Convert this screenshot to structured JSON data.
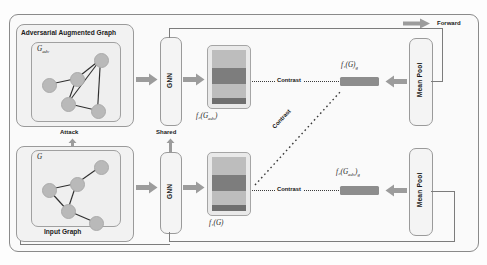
{
  "figure": {
    "type": "architecture-diagram"
  },
  "legend": {
    "forward_label": "Forward",
    "arrow_icon": "right-arrow-icon"
  },
  "branches": {
    "top": {
      "panel_title": "Adversarial Augmented Graph",
      "graph_symbol": "G",
      "graph_subscript": "adv",
      "encoder_label": "GNN",
      "feature_map_label": "f₂(G",
      "feature_map_sub": "adv",
      "feature_map_tail": ")",
      "embedding_label": "f₂(G",
      "embedding_sub": "adv",
      "embedding_tail": ")",
      "embedding_tail_sub": "g",
      "pool_label": "Mean Pool"
    },
    "bottom": {
      "panel_caption": "Input Graph",
      "graph_symbol": "G",
      "encoder_label": "GNN",
      "feature_map_label": "f₁(G)",
      "embedding_label": "f₁(G)",
      "embedding_sub": "g",
      "pool_label": "Mean Pool"
    }
  },
  "connectors": {
    "attack_label": "Attack",
    "shared_label": "Shared",
    "contrast_top_label": "Contrast",
    "contrast_diagonal_label": "Contrast",
    "contrast_bottom_label": "Contrast"
  },
  "graph_top": {
    "nodes": [
      {
        "id": "n1",
        "x": 11,
        "y": 36
      },
      {
        "id": "n2",
        "x": 39,
        "y": 30
      },
      {
        "id": "n3",
        "x": 63,
        "y": 11
      },
      {
        "id": "n4",
        "x": 30,
        "y": 55
      },
      {
        "id": "n5",
        "x": 60,
        "y": 62
      }
    ],
    "edges": [
      {
        "from": "n1",
        "to": "n2"
      },
      {
        "from": "n2",
        "to": "n3"
      },
      {
        "from": "n2",
        "to": "n4"
      },
      {
        "from": "n4",
        "to": "n3"
      },
      {
        "from": "n4",
        "to": "n5"
      },
      {
        "from": "n3",
        "to": "n5"
      }
    ]
  },
  "graph_bottom": {
    "nodes": [
      {
        "id": "m1",
        "x": 11,
        "y": 33
      },
      {
        "id": "m2",
        "x": 39,
        "y": 27
      },
      {
        "id": "m3",
        "x": 63,
        "y": 10
      },
      {
        "id": "m4",
        "x": 30,
        "y": 54
      },
      {
        "id": "m5",
        "x": 58,
        "y": 66
      }
    ],
    "edges": [
      {
        "from": "m1",
        "to": "m2"
      },
      {
        "from": "m2",
        "to": "m3"
      },
      {
        "from": "m2",
        "to": "m4"
      },
      {
        "from": "m4",
        "to": "m1"
      },
      {
        "from": "m4",
        "to": "m5"
      }
    ]
  },
  "feature_map": {
    "stripes": [
      {
        "top": 0,
        "height": 18,
        "color": "#bdbdbd"
      },
      {
        "top": 18,
        "height": 16,
        "color": "#7d7d7d"
      },
      {
        "top": 34,
        "height": 14,
        "color": "#bdbdbd"
      },
      {
        "top": 48,
        "height": 16,
        "color": "#6f6f6f"
      }
    ]
  },
  "colors": {
    "frame_border": "#8a8a8a",
    "panel_fill": "#f2f2f2",
    "node_fill": "#b9b9b9",
    "edge_stroke": "#2f2f2f",
    "arrow_fill": "#9c9c9c",
    "embedding_fill": "#8d8d8d",
    "text": "#1b1b1b"
  }
}
